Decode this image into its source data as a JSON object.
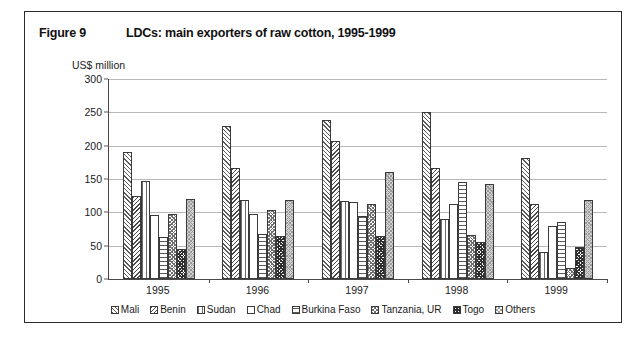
{
  "figure": {
    "label": "Figure 9",
    "title": "LDCs: main exporters of raw cotton, 1995-1999"
  },
  "chart_data": {
    "type": "bar",
    "title": "LDCs: main exporters of raw cotton, 1995-1999",
    "xlabel": "",
    "ylabel": "US$ million",
    "ylim": [
      0,
      300
    ],
    "yticks": [
      0,
      50,
      100,
      150,
      200,
      250,
      300
    ],
    "grid": true,
    "legend_position": "bottom",
    "categories": [
      "1995",
      "1996",
      "1997",
      "1998",
      "1999"
    ],
    "series": [
      {
        "name": "Mali",
        "pattern": "diagonal-hatch-up",
        "values": [
          190,
          230,
          238,
          250,
          182
        ]
      },
      {
        "name": "Benin",
        "pattern": "diagonal-hatch-down",
        "values": [
          125,
          166,
          207,
          166,
          112
        ]
      },
      {
        "name": "Sudan",
        "pattern": "vertical-lines",
        "values": [
          147,
          119,
          117,
          90,
          41
        ]
      },
      {
        "name": "Chad",
        "pattern": "solid-white",
        "values": [
          96,
          97,
          115,
          112,
          80
        ]
      },
      {
        "name": "Burkina Faso",
        "pattern": "horizontal-lines",
        "values": [
          63,
          68,
          94,
          145,
          85
        ]
      },
      {
        "name": "Tanzania, UR",
        "pattern": "fine-crosshatch",
        "values": [
          98,
          103,
          112,
          66,
          17
        ]
      },
      {
        "name": "Togo",
        "pattern": "dark-crosshatch",
        "values": [
          45,
          65,
          65,
          56,
          48
        ]
      },
      {
        "name": "Others",
        "pattern": "light-grey-dotted",
        "values": [
          120,
          118,
          161,
          142,
          118
        ]
      }
    ]
  },
  "legend": {
    "items": [
      {
        "label": "Mali"
      },
      {
        "label": "Benin"
      },
      {
        "label": "Sudan"
      },
      {
        "label": "Chad"
      },
      {
        "label": "Burkina Faso"
      },
      {
        "label": "Tanzania, UR"
      },
      {
        "label": "Togo"
      },
      {
        "label": "Others"
      }
    ]
  }
}
